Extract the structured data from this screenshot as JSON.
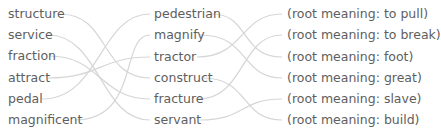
{
  "left_column": [
    "structure",
    "service",
    "fraction",
    "attract",
    "pedal",
    "magnificent"
  ],
  "middle_column": [
    "pedestrian",
    "magnify",
    "tractor",
    "construct",
    "fracture",
    "servant"
  ],
  "right_column": [
    "(root meaning: to pull)",
    "(root meaning: to break)",
    "(root meaning: foot)",
    "(root meaning: great)",
    "(root meaning: slave)",
    "(root meaning: build)"
  ],
  "connections_left_to_middle": [
    [
      "structure",
      "construct"
    ],
    [
      "service",
      "servant"
    ],
    [
      "fraction",
      "fracture"
    ],
    [
      "attract",
      "tractor"
    ],
    [
      "pedal",
      "pedestrian"
    ],
    [
      "magnificent",
      "magnify"
    ]
  ],
  "connections_middle_to_right": [
    [
      "pedestrian",
      "(root meaning: foot)"
    ],
    [
      "magnify",
      "(root meaning: great)"
    ],
    [
      "tractor",
      "(root meaning: to pull)"
    ],
    [
      "construct",
      "(root meaning: build)"
    ],
    [
      "fracture",
      "(root meaning: to break)"
    ],
    [
      "servant",
      "(root meaning: slave)"
    ]
  ],
  "line_color": "#d4d4d4"
}
